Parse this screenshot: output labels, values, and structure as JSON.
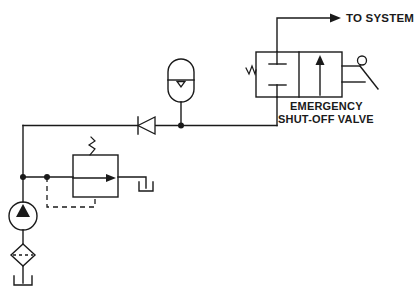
{
  "diagram": {
    "background_color": "#ffffff",
    "line_color": "#1a1a1a",
    "labels": {
      "to_system": "TO SYSTEM",
      "valve_name_line1": "EMERGENCY",
      "valve_name_line2": "SHUT-OFF VALVE"
    },
    "components": [
      {
        "id": "directional-valve",
        "name": "Emergency shut-off valve",
        "type": "2-position 2-way directional control valve",
        "label": "EMERGENCY SHUT-OFF VALVE",
        "left_actuator": "spring",
        "right_actuator": "manual-lever",
        "position_left": "blocked-ports",
        "position_right": "flow-through-arrow"
      },
      {
        "id": "accumulator",
        "name": "Accumulator",
        "type": "gas-charged accumulator"
      },
      {
        "id": "check-valve",
        "name": "Check valve",
        "type": "non-return valve",
        "flow_direction": "left"
      },
      {
        "id": "relief-valve",
        "name": "Pressure relief valve",
        "type": "pilot-operated relief valve",
        "actuator": "spring",
        "pilot_line": "dashed"
      },
      {
        "id": "pump",
        "name": "Pump",
        "type": "fixed displacement hydraulic pump",
        "flow_direction": "up"
      },
      {
        "id": "filter",
        "name": "Filter",
        "type": "inline filter / strainer"
      },
      {
        "id": "reservoir-pump",
        "name": "Reservoir",
        "type": "tank"
      },
      {
        "id": "reservoir-relief",
        "name": "Reservoir",
        "type": "tank"
      }
    ]
  }
}
